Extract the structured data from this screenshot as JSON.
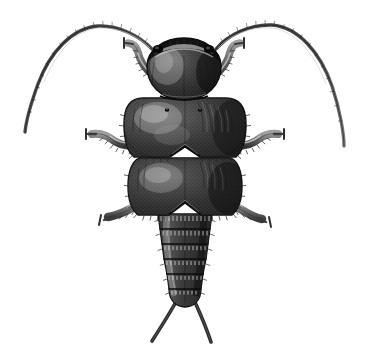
{
  "figure": {
    "title": "Dorsal view of an insect",
    "subject_common_name": "Insect nymph, dorsal aspect",
    "medium": "pen-and-ink stipple / engraving style scientific illustration",
    "orientation": "dorsal (viewed from above), head at top, abdomen at bottom",
    "canvas": {
      "width": 366,
      "height": 364
    },
    "background_color": "#ffffff",
    "caption": "",
    "labels": [],
    "scale_bar": null
  },
  "palette": {
    "background": "#ffffff",
    "ink_darkest": "#1c1c1c",
    "ink_dark": "#2e2e2e",
    "ink_mid": "#4a4a4a",
    "ink_light": "#6e6e6e",
    "ink_pale": "#9a9a9a",
    "highlight": "#b9b9b9",
    "sheen": "#d4d4d4"
  },
  "anatomy": {
    "head": {
      "name": "head capsule",
      "shape": "rounded dome, widest at mid-height, narrowing at the vertex",
      "bounds": {
        "x": 146,
        "y": 38,
        "width": 76,
        "height": 62
      },
      "center_x": 184,
      "tone": "very dark with a pale curved sheen on the left dome",
      "features": {
        "frontal_band": "pale transverse band along the upper margin (clypeus / labrum edge)",
        "eyes": [
          {
            "name": "left compound eye",
            "cx": 158,
            "cy": 48,
            "rx": 5,
            "ry": 4
          },
          {
            "name": "right compound eye",
            "cx": 209,
            "cy": 48,
            "rx": 5,
            "ry": 4
          }
        ],
        "median_suture": "faint vertical midline on the vertex"
      }
    },
    "pronotum": {
      "name": "pronotum (first thoracic plate)",
      "bounds": {
        "x": 124,
        "y": 98,
        "width": 122,
        "height": 62
      },
      "shape": "broad trapezoid with strongly rounded lateral corners and a shallow V-notch on the posterior margin",
      "posterior_notch": "shallow median V",
      "surface": "dense stipple with two small paired punctures near the anterior margin and a bright sheen on the left half",
      "punctures": [
        {
          "cx": 167,
          "cy": 110
        },
        {
          "cx": 200,
          "cy": 110
        }
      ],
      "marginal_setae": "short bristle fringe along the lateral and posterior edges"
    },
    "mesonotum": {
      "name": "mesonotum (second thoracic plate / elytral region)",
      "bounds": {
        "x": 128,
        "y": 158,
        "width": 114,
        "height": 58
      },
      "shape": "broad rounded rectangle narrowing posteriorly, with a V-notch on the posterior margin",
      "surface": "dense stipple, darker toward the right margin",
      "marginal_setae": "bristle fringe on lateral and posterior edges"
    },
    "abdomen": {
      "name": "abdomen",
      "bounds": {
        "x": 158,
        "y": 214,
        "width": 56,
        "height": 92
      },
      "taper": "tapers from 54 px wide at the base to 30 px wide at the terminal segment",
      "segment_count": 6,
      "segments": [
        {
          "index": 1,
          "y_top": 214,
          "y_bottom": 229,
          "half_width_top": 27,
          "half_width_bottom": 25
        },
        {
          "index": 2,
          "y_top": 229,
          "y_bottom": 244,
          "half_width_top": 25,
          "half_width_bottom": 23
        },
        {
          "index": 3,
          "y_top": 244,
          "y_bottom": 259,
          "half_width_top": 23,
          "half_width_bottom": 21
        },
        {
          "index": 4,
          "y_top": 259,
          "y_bottom": 274,
          "half_width_top": 21,
          "half_width_bottom": 18
        },
        {
          "index": 5,
          "y_top": 274,
          "y_bottom": 289,
          "half_width_top": 18,
          "half_width_bottom": 16
        },
        {
          "index": 6,
          "y_top": 289,
          "y_bottom": 306,
          "half_width_top": 16,
          "half_width_bottom": 12
        }
      ],
      "segment_edge_detail": "each tergite rear margin carries a fine comb of bristles/denticles"
    },
    "cerci": [
      {
        "name": "left cercus",
        "from": {
          "x": 177,
          "y": 302
        },
        "to": {
          "x": 152,
          "y": 340
        },
        "description": "long slender tapering filament angled down-left"
      },
      {
        "name": "right cercus",
        "from": {
          "x": 195,
          "y": 302
        },
        "to": {
          "x": 211,
          "y": 341
        },
        "description": "long slender tapering filament angled down-right"
      }
    ],
    "antennae": [
      {
        "name": "left antenna",
        "side": "left",
        "base": {
          "x": 152,
          "y": 48
        },
        "apex": {
          "x": 95,
          "y": 25
        },
        "tip": {
          "x": 26,
          "y": 132
        },
        "description": "long multiarticulate filament sweeping up, over and down to the lower left; thick at base, hair-fine at tip; faint annulations along the shaft"
      },
      {
        "name": "right antenna",
        "side": "right",
        "base": {
          "x": 216,
          "y": 48
        },
        "apex": {
          "x": 276,
          "y": 25
        },
        "tip": {
          "x": 344,
          "y": 146
        },
        "description": "mirror of the left antenna, sweeping up, over and down to the lower right"
      }
    ],
    "legs": [
      {
        "name": "left foreleg",
        "pair": "fore",
        "side": "left",
        "attachment": {
          "x": 150,
          "y": 72
        },
        "direction": "up and outward to the left",
        "claw_tip": {
          "x": 122,
          "y": 42
        },
        "spines": "row of short spines on the outer tibial edge"
      },
      {
        "name": "right foreleg",
        "pair": "fore",
        "side": "right",
        "attachment": {
          "x": 218,
          "y": 72
        },
        "direction": "up and outward to the right",
        "claw_tip": {
          "x": 246,
          "y": 42
        },
        "spines": "row of short spines on the outer tibial edge"
      },
      {
        "name": "left midleg",
        "pair": "mid",
        "side": "left",
        "attachment": {
          "x": 128,
          "y": 140
        },
        "direction": "outward and slightly up to the left",
        "claw_tip": {
          "x": 88,
          "y": 134
        },
        "spines": "spinose tibia with bristle fringe"
      },
      {
        "name": "right midleg",
        "pair": "mid",
        "side": "right",
        "attachment": {
          "x": 242,
          "y": 140
        },
        "direction": "outward and slightly up to the right",
        "claw_tip": {
          "x": 280,
          "y": 134
        },
        "spines": "spinose tibia with bristle fringe"
      },
      {
        "name": "left hindleg",
        "pair": "hind",
        "side": "left",
        "attachment": {
          "x": 146,
          "y": 200
        },
        "direction": "outward and down to the left",
        "claw_tip": {
          "x": 108,
          "y": 218
        },
        "spines": "spinose tibia, slender tarsus, small forked claw"
      },
      {
        "name": "right hindleg",
        "pair": "hind",
        "side": "right",
        "attachment": {
          "x": 224,
          "y": 200
        },
        "direction": "outward and down to the right",
        "claw_tip": {
          "x": 262,
          "y": 220
        },
        "spines": "spinose tibia, slender tarsus, small forked claw"
      }
    ]
  },
  "measurements": {
    "body_axis_x": 185,
    "body_top_y": 38,
    "body_bottom_y": 306,
    "body_length_px": 268,
    "max_body_width_px": 122,
    "antenna_span_px": 318,
    "total_drawing_height_px": 316
  }
}
